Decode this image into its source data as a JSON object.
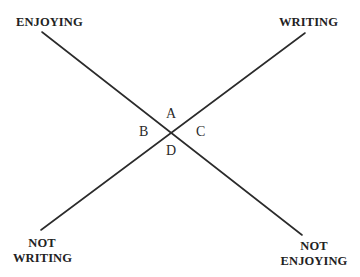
{
  "diagram": {
    "type": "crossing-axes",
    "line_color": "#2b2b2b",
    "text_color": "#222222",
    "corners": {
      "top_left": "ENJOYING",
      "top_right": "WRITING",
      "bottom_left": [
        "NOT",
        "WRITING"
      ],
      "bottom_right": [
        "NOT",
        "ENJOYING"
      ]
    },
    "quadrants": {
      "top": "A",
      "left": "B",
      "right": "C",
      "bottom": "D"
    },
    "lines": [
      {
        "name": "enjoying-axis",
        "from": "ENJOYING",
        "to": "NOT ENJOYING",
        "x1": 42,
        "y1": 32,
        "x2": 302,
        "y2": 235
      },
      {
        "name": "writing-axis",
        "from": "WRITING",
        "to": "NOT WRITING",
        "x1": 305,
        "y1": 33,
        "x2": 41,
        "y2": 230
      }
    ]
  }
}
